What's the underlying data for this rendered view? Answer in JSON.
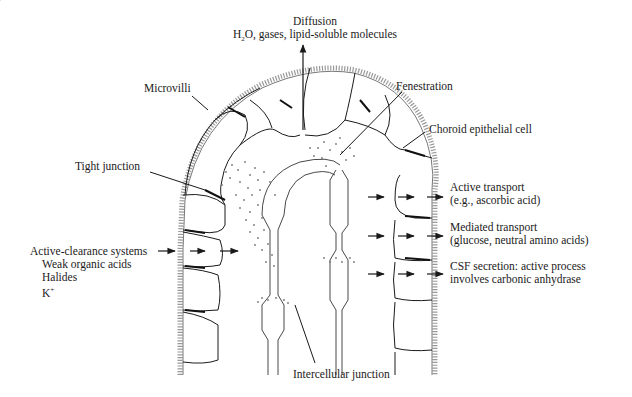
{
  "diagram": {
    "labels": {
      "diffusion": {
        "title": "Diffusion",
        "subtitle_prefix": "H",
        "subtitle_sub": "2",
        "subtitle_rest": "O, gases, lipid-soluble molecules"
      },
      "microvilli": "Microvilli",
      "fenestration": "Fenestration",
      "choroid_epithelial_cell": "Choroid epithelial cell",
      "tight_junction": "Tight junction",
      "active_transport": {
        "line1": "Active transport",
        "line2": "(e.g., ascorbic acid)"
      },
      "mediated_transport": {
        "line1": "Mediated transport",
        "line2": "(glucose, neutral amino acids)"
      },
      "csf_secretion": {
        "line1": "CSF secretion: active process",
        "line2": "involves carbonic anhydrase"
      },
      "active_clearance": {
        "title": "Active-clearance systems",
        "items": [
          "Weak organic acids",
          "Halides",
          "K"
        ],
        "k_superscript": "+"
      },
      "intercellular_junction": "Intercellular junction"
    },
    "colors": {
      "ink": "#1a1a1a",
      "stipple": "#777777",
      "background": "#ffffff"
    }
  }
}
